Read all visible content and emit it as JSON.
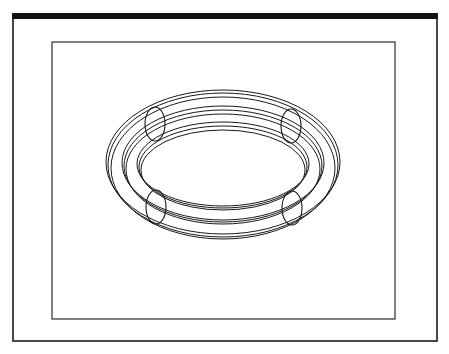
{
  "figure": {
    "colors": {
      "background": "#ffffff",
      "stroke": "#1a1a1a"
    },
    "outer_frame": {
      "x": 13,
      "y": 14,
      "width": 424,
      "height": 327,
      "top_bar_thickness": 6
    },
    "inner_frame": {
      "x": 52,
      "y": 42,
      "width": 343,
      "height": 277
    },
    "torus": {
      "center": [
        223,
        166
      ],
      "ellipses": [
        {
          "cx": 223,
          "cy": 162,
          "rx": 117,
          "ry": 72
        },
        {
          "cx": 223,
          "cy": 165,
          "rx": 115,
          "ry": 72
        },
        {
          "cx": 223,
          "cy": 168,
          "rx": 112,
          "ry": 71
        },
        {
          "cx": 223,
          "cy": 163,
          "rx": 101,
          "ry": 57
        },
        {
          "cx": 223,
          "cy": 166,
          "rx": 99,
          "ry": 56
        },
        {
          "cx": 223,
          "cy": 169,
          "rx": 97,
          "ry": 55
        },
        {
          "cx": 223,
          "cy": 164,
          "rx": 86,
          "ry": 42
        },
        {
          "cx": 223,
          "cy": 167,
          "rx": 84,
          "ry": 41
        },
        {
          "cx": 223,
          "cy": 170,
          "rx": 82,
          "ry": 40
        }
      ],
      "tube_sections": [
        {
          "name": "top-left",
          "cx": 155,
          "cy": 124,
          "rx": 10,
          "ry": 17
        },
        {
          "name": "top-right",
          "cx": 291,
          "cy": 126,
          "rx": 10,
          "ry": 17
        },
        {
          "name": "bottom-left",
          "cx": 156,
          "cy": 207,
          "rx": 10,
          "ry": 17
        },
        {
          "name": "bottom-right",
          "cx": 292,
          "cy": 208,
          "rx": 10,
          "ry": 17
        }
      ]
    }
  }
}
